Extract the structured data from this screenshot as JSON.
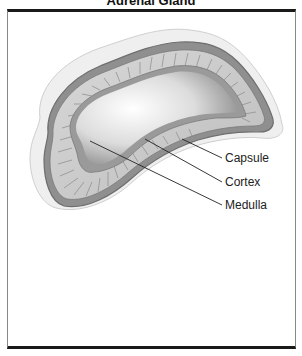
{
  "figure": {
    "title": "Adrenal Gland",
    "labels": [
      {
        "id": "capsule",
        "text": "Capsule"
      },
      {
        "id": "cortex",
        "text": "Cortex"
      },
      {
        "id": "medulla",
        "text": "Medulla"
      }
    ]
  },
  "colors": {
    "frame_border": "#1a1a1a",
    "capsule": "#8a8a8a",
    "cortex": "#c9c9c9",
    "medulla": "#e6e6e6",
    "fat_halo": "#ececec",
    "leader_line": "#222222"
  }
}
